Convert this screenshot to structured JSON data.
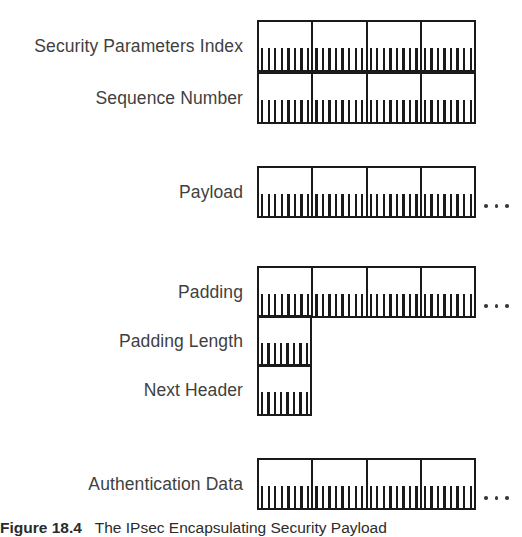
{
  "figure": {
    "caption_label": "Figure 18.4",
    "caption_text": "The IPsec Encapsulating Security Payload",
    "ink_color": "#1a1a1a",
    "label_color": "#3f3f3f",
    "background": "#ffffff"
  },
  "diagram": {
    "bits_per_row": 32,
    "cells_per_row": 4,
    "ticks_per_cell": 8,
    "continuation_glyph": "...",
    "blocks": [
      {
        "name": "header-block",
        "rows": [
          {
            "label": "Security Parameters Index",
            "cells": 4,
            "continues": false
          },
          {
            "label": "Sequence Number",
            "cells": 4,
            "continues": false
          }
        ]
      },
      {
        "name": "payload-block",
        "rows": [
          {
            "label": "Payload",
            "cells": 4,
            "continues": true
          }
        ]
      },
      {
        "name": "trailer-block",
        "rows": [
          {
            "label": "Padding",
            "cells": 4,
            "continues": true
          },
          {
            "label": "Padding Length",
            "cells": 1,
            "continues": false
          },
          {
            "label": "Next Header",
            "cells": 1,
            "continues": false
          }
        ]
      },
      {
        "name": "auth-block",
        "rows": [
          {
            "label": "Authentication Data",
            "cells": 4,
            "continues": true
          }
        ]
      }
    ]
  }
}
